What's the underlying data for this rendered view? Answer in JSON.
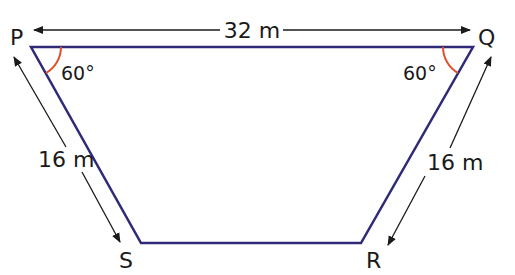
{
  "diagram": {
    "type": "trapezium",
    "colors": {
      "shape_stroke": "#2e2a78",
      "angle_arc": "#e0502a",
      "arrow": "#1a1a1a",
      "text": "#1a1a1a"
    },
    "vertices": {
      "P": {
        "label": "P"
      },
      "Q": {
        "label": "Q"
      },
      "R": {
        "label": "R"
      },
      "S": {
        "label": "S"
      }
    },
    "dimensions": {
      "top": "32 m",
      "left": "16 m",
      "right": "16 m"
    },
    "angles": {
      "P": "60°",
      "Q": "60°"
    }
  }
}
